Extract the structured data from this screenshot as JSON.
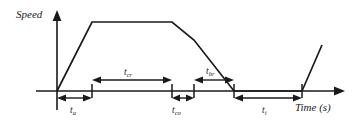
{
  "figure": {
    "kind": "speed-time-profile-diagram",
    "axes": {
      "y_label": "Speed",
      "x_label": "Time (s)",
      "origin": [
        57,
        91
      ],
      "y_top": 12,
      "x_right": 345
    },
    "segments": [
      {
        "id": "t_a",
        "base": "t",
        "sub": "a",
        "label": "ta",
        "meaning": "acceleration",
        "position": "below-axis",
        "x_from": 57,
        "x_to": 92
      },
      {
        "id": "t_cr",
        "base": "t",
        "sub": "cr",
        "label": "tcr",
        "meaning": "cruise",
        "position": "above-axis",
        "x_from": 92,
        "x_to": 172
      },
      {
        "id": "t_co",
        "base": "t",
        "sub": "co",
        "label": "tco",
        "meaning": "coast",
        "position": "below-axis",
        "x_from": 172,
        "x_to": 194
      },
      {
        "id": "t_br",
        "base": "t",
        "sub": "br",
        "label": "tbr",
        "meaning": "braking",
        "position": "above-axis",
        "x_from": 194,
        "x_to": 234
      },
      {
        "id": "t_i",
        "base": "t",
        "sub": "i",
        "label": "ti",
        "meaning": "idle/dwell",
        "position": "below-axis",
        "x_from": 234,
        "x_to": 302
      }
    ],
    "ticks_x": [
      92,
      172,
      194,
      234,
      302
    ],
    "curve_points": "57,91 92,22 172,22 194,40 234,91 302,91 322,45",
    "colors": {
      "ink": "#1a1a1a",
      "background": "#ffffff"
    }
  }
}
